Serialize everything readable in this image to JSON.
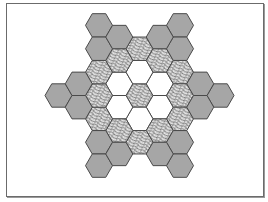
{
  "diagram": {
    "center": [
      139.5,
      95.5
    ],
    "hex_radius": 13.5,
    "colors": {
      "gray_fill": "#a6a6a6",
      "white_fill": "#ffffff",
      "texture_fill": "#e4e4e4",
      "texture_stroke": "#3a3a3a",
      "edge": "#4a4a4a",
      "frame": "#6b6b6b"
    },
    "tile_types": [
      "textured",
      "white",
      "gray"
    ],
    "tiles": [
      {
        "q": 0,
        "r": 0,
        "type": "textured"
      },
      {
        "q": 1,
        "r": -1,
        "type": "white"
      },
      {
        "q": 1,
        "r": 0,
        "type": "white"
      },
      {
        "q": 0,
        "r": 1,
        "type": "white"
      },
      {
        "q": -1,
        "r": 1,
        "type": "white"
      },
      {
        "q": -1,
        "r": 0,
        "type": "white"
      },
      {
        "q": 0,
        "r": -1,
        "type": "white"
      },
      {
        "q": 0,
        "r": -2,
        "type": "textured"
      },
      {
        "q": 1,
        "r": -2,
        "type": "textured"
      },
      {
        "q": 2,
        "r": -2,
        "type": "textured"
      },
      {
        "q": 2,
        "r": -1,
        "type": "textured"
      },
      {
        "q": 2,
        "r": 0,
        "type": "textured"
      },
      {
        "q": 1,
        "r": 1,
        "type": "textured"
      },
      {
        "q": 0,
        "r": 2,
        "type": "textured"
      },
      {
        "q": -1,
        "r": 2,
        "type": "textured"
      },
      {
        "q": -2,
        "r": 2,
        "type": "textured"
      },
      {
        "q": -2,
        "r": 1,
        "type": "textured"
      },
      {
        "q": -2,
        "r": 0,
        "type": "textured"
      },
      {
        "q": -1,
        "r": -1,
        "type": "textured"
      },
      {
        "q": -2,
        "r": -2,
        "type": "gray"
      },
      {
        "q": -2,
        "r": -1,
        "type": "gray"
      },
      {
        "q": -1,
        "r": -2,
        "type": "gray"
      },
      {
        "q": 2,
        "r": -4,
        "type": "gray"
      },
      {
        "q": 2,
        "r": -3,
        "type": "gray"
      },
      {
        "q": 1,
        "r": -3,
        "type": "gray"
      },
      {
        "q": 4,
        "r": -2,
        "type": "gray"
      },
      {
        "q": 3,
        "r": -2,
        "type": "gray"
      },
      {
        "q": 3,
        "r": -1,
        "type": "gray"
      },
      {
        "q": 2,
        "r": 1,
        "type": "gray"
      },
      {
        "q": 2,
        "r": 2,
        "type": "gray"
      },
      {
        "q": 1,
        "r": 2,
        "type": "gray"
      },
      {
        "q": -2,
        "r": 3,
        "type": "gray"
      },
      {
        "q": -2,
        "r": 4,
        "type": "gray"
      },
      {
        "q": -1,
        "r": 3,
        "type": "gray"
      },
      {
        "q": -4,
        "r": 2,
        "type": "gray"
      },
      {
        "q": -3,
        "r": 1,
        "type": "gray"
      },
      {
        "q": -3,
        "r": 2,
        "type": "gray"
      }
    ]
  }
}
